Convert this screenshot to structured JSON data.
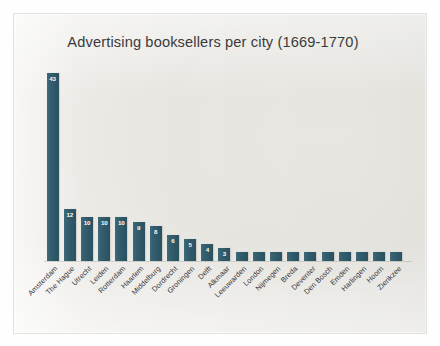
{
  "chart_data": {
    "type": "bar",
    "title": "Advertising booksellers per city (1669-1770)",
    "xlabel": "",
    "ylabel": "",
    "ylim": [
      0,
      45
    ],
    "grid": false,
    "legend": false,
    "orientation": "vertical",
    "bar_color": "#2f5868",
    "value_label_color": "#ffffff",
    "categories": [
      "Amsterdam",
      "The Hague",
      "Utrecht",
      "Leiden",
      "Rotterdam",
      "Haarlem",
      "Middelburg",
      "Dordrecht",
      "Groningen",
      "Delft",
      "Alkmaar",
      "Leeuwarden",
      "London",
      "Nijmegen",
      "Breda",
      "Deventer",
      "Den Bosch",
      "Emden",
      "Harlingen",
      "Hoorn",
      "Zierikzee"
    ],
    "values": [
      43,
      12,
      10,
      10,
      10,
      9,
      8,
      6,
      5,
      4,
      3,
      2,
      2,
      2,
      2,
      2,
      2,
      2,
      2,
      2,
      2
    ],
    "value_labels": [
      "43",
      "12",
      "10",
      "10",
      "10",
      "9",
      "8",
      "6",
      "5",
      "4",
      "3",
      "",
      "",
      "",
      "",
      "",
      "",
      "",
      "",
      "",
      ""
    ]
  }
}
